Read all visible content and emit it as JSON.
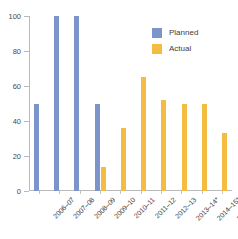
{
  "chart_data": {
    "type": "bar",
    "title": "",
    "subtitle": "",
    "xlabel": "",
    "ylabel": "",
    "ylim": [
      0,
      100
    ],
    "yticks": [
      "0",
      "20",
      "40",
      "60",
      "80",
      "100"
    ],
    "grid": false,
    "legend_position": "top-right-inside",
    "categories": [
      "2006–07",
      "2007–08",
      "2008–09",
      "2009–10",
      "2010–11",
      "2011–12",
      "2012–13",
      "2013–14*",
      "2014–15*",
      "2015–16*"
    ],
    "series": [
      {
        "name": "Planned",
        "color": "#7b94c9",
        "values": [
          50,
          100,
          100,
          50,
          null,
          null,
          null,
          null,
          null,
          null
        ]
      },
      {
        "name": "Actual",
        "color": "#f5bc42",
        "values": [
          null,
          null,
          null,
          14,
          36,
          65,
          52,
          50,
          50,
          33
        ]
      }
    ]
  },
  "legend": {
    "items": [
      {
        "label": "Planned",
        "color": "#7b94c9"
      },
      {
        "label": "Actual",
        "color": "#f5bc42"
      }
    ]
  },
  "axis": {
    "y_ticks": [
      {
        "label": "100",
        "value": 100
      },
      {
        "label": "80",
        "value": 80
      },
      {
        "label": "60",
        "value": 60
      },
      {
        "label": "40",
        "value": 40
      },
      {
        "label": "20",
        "value": 20
      },
      {
        "label": "0",
        "value": 0
      }
    ],
    "x_labels": [
      "2006–07",
      "2007–08",
      "2008–09",
      "2009–10",
      "2010–11",
      "2011–12",
      "2012–13",
      "2013–14*",
      "2014–15*",
      "2015–16*"
    ]
  },
  "colors": {
    "planned": "#7b94c9",
    "actual": "#f5bc42",
    "axis": "#b9b9b9",
    "text": "#3d3d3d",
    "background": "#ffffff"
  }
}
